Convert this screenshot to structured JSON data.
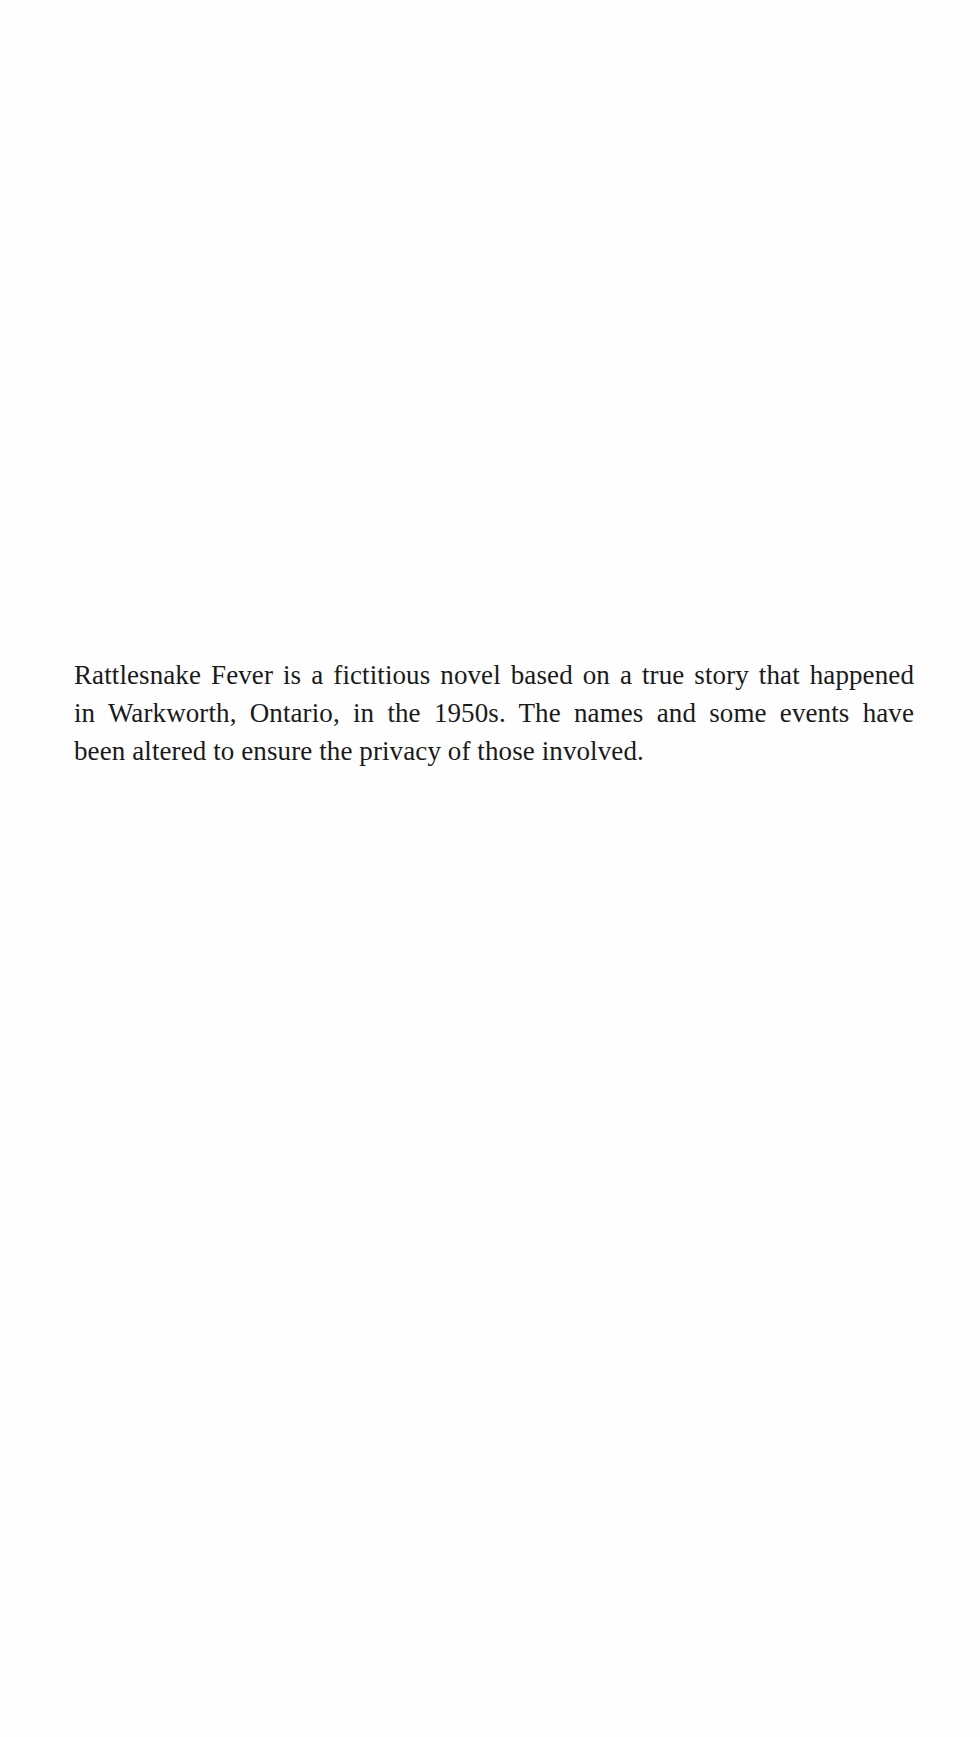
{
  "page": {
    "background": "#fefefe",
    "text_color": "#1a1a1a"
  },
  "disclaimer": {
    "lines": [
      "Rattlesnake Fever is a fictitious novel based on a true story that happened",
      "in Warkworth, Ontario, in the 1950s. The names and some events have",
      "been altered to ensure the privacy of those involved."
    ],
    "full_text": "Rattlesnake Fever is a fictitious novel based on a true story that happened in Warkworth, Ontario, in the 1950s. The names and some events have been altered to ensure the privacy of those involved."
  }
}
